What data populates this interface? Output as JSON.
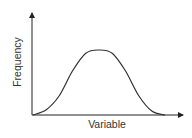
{
  "chart_data": {
    "type": "line",
    "title": "",
    "xlabel": "Variable",
    "ylabel": "Frequency",
    "grid": false,
    "legend": null,
    "x_ticks": [],
    "y_ticks": [],
    "x": [
      0,
      0.1,
      0.2,
      0.3,
      0.4,
      0.5,
      0.6,
      0.7,
      0.8,
      0.9,
      1.0
    ],
    "values": [
      0.0,
      0.08,
      0.3,
      0.68,
      0.95,
      1.0,
      0.95,
      0.68,
      0.3,
      0.06,
      0.0
    ]
  },
  "colors": {
    "line": "#333333",
    "text": "#333333",
    "background": "#ffffff"
  }
}
